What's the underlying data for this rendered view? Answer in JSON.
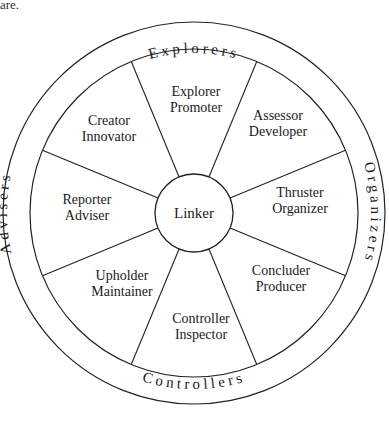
{
  "fragment_text": "are.",
  "diagram": {
    "type": "team-role-wheel",
    "center": {
      "x": 194,
      "y": 213
    },
    "outer_radius": 191,
    "inner_radius": 164,
    "hub_radius": 39,
    "hub_label": "Linker",
    "spoke_angles_deg": [
      22.5,
      67.5,
      112.5,
      157.5,
      202.5,
      247.5,
      292.5,
      337.5
    ],
    "segments": [
      {
        "line1": "Explorer",
        "line2": "Promoter",
        "x": 196,
        "y": 104
      },
      {
        "line1": "Assessor",
        "line2": "Developer",
        "x": 278,
        "y": 128
      },
      {
        "line1": "Thruster",
        "line2": "Organizer",
        "x": 300,
        "y": 205
      },
      {
        "line1": "Concluder",
        "line2": "Producer",
        "x": 281,
        "y": 283
      },
      {
        "line1": "Controller",
        "line2": "Inspector",
        "x": 201,
        "y": 331
      },
      {
        "line1": "Upholder",
        "line2": "Maintainer",
        "x": 122,
        "y": 288
      },
      {
        "line1": "Reporter",
        "line2": "Adviser",
        "x": 87,
        "y": 212
      },
      {
        "line1": "Creator",
        "line2": "Innovator",
        "x": 109,
        "y": 133
      }
    ],
    "ring_labels": {
      "top": "Explorers",
      "right": "Organizers",
      "bottom": "Controllers",
      "left": "Advisers"
    }
  }
}
